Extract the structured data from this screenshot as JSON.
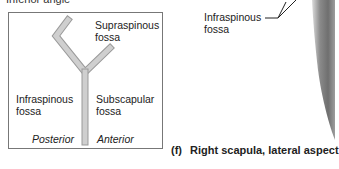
{
  "top_partial_label": "Inferior angle",
  "schematic": {
    "supraspinous": [
      "Supraspinous",
      "fossa"
    ],
    "infraspinous": [
      "Infraspinous",
      "fossa"
    ],
    "subscapular": [
      "Subscapular",
      "fossa"
    ],
    "posterior": "Posterior",
    "anterior": "Anterior"
  },
  "photo_label": [
    "Infraspinous",
    "fossa"
  ],
  "caption": {
    "letter": "(f)",
    "text": "Right scapula, lateral aspect"
  },
  "colors": {
    "schematic_bone": "#c9c9c9",
    "schematic_bone_edge": "#9a9a9a",
    "box_border": "#777777"
  }
}
